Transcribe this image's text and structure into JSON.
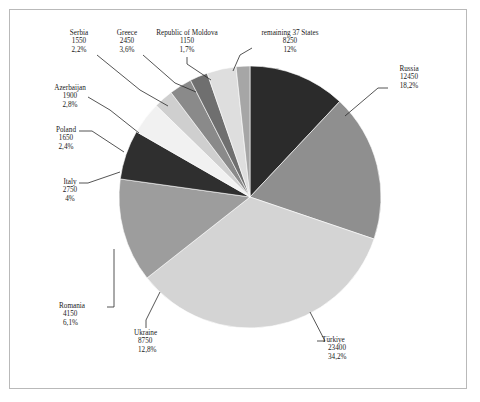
{
  "chart_data": {
    "type": "pie",
    "title": "",
    "subtitle": "",
    "xlabel": "",
    "ylabel": "",
    "legend_position": "callout-labels",
    "grid": false,
    "total": 68400,
    "value_label_separator": ",",
    "percent_symbol": "%",
    "categories": [
      "remaining 37 States",
      "Russia",
      "Türkiye",
      "Ukraine",
      "Romania",
      "Italy",
      "Poland",
      "Azerbaijan",
      "Serbia",
      "Greece",
      "Republic of Moldova"
    ],
    "values": [
      8250,
      12450,
      23400,
      8750,
      4150,
      2750,
      1650,
      1900,
      1550,
      2450,
      1150
    ],
    "percents": [
      "12%",
      "18,2%",
      "34,2%",
      "12,8%",
      "6,1%",
      "4%",
      "2,4%",
      "2,8%",
      "2,2%",
      "3,6%",
      "1,7%"
    ],
    "percent_numeric": [
      12.0,
      18.2,
      34.2,
      12.8,
      6.1,
      4.0,
      2.4,
      2.8,
      2.2,
      3.6,
      1.7
    ],
    "colors": [
      "#2b2b2b",
      "#8f8f8f",
      "#d4d4d4",
      "#9d9d9d",
      "#2f2f2f",
      "#f1f1f1",
      "#cfcfcf",
      "#8a8a8a",
      "#6f6f6f",
      "#dedede",
      "#a6a6a6"
    ],
    "slices": [
      {
        "label": "remaining 37 States",
        "value": "8250",
        "percent": "12%",
        "color": "#2b2b2b"
      },
      {
        "label": "Russia",
        "value": "12450",
        "percent": "18,2%",
        "color": "#8f8f8f"
      },
      {
        "label": "Türkiye",
        "value": "23400",
        "percent": "34,2%",
        "color": "#d4d4d4"
      },
      {
        "label": "Ukraine",
        "value": "8750",
        "percent": "12,8%",
        "color": "#9d9d9d"
      },
      {
        "label": "Romania",
        "value": "4150",
        "percent": "6,1%",
        "color": "#2f2f2f"
      },
      {
        "label": "Italy",
        "value": "2750",
        "percent": "4%",
        "color": "#f1f1f1"
      },
      {
        "label": "Poland",
        "value": "1650",
        "percent": "2,4%",
        "color": "#cfcfcf"
      },
      {
        "label": "Azerbaijan",
        "value": "1900",
        "percent": "2,8%",
        "color": "#8a8a8a"
      },
      {
        "label": "Serbia",
        "value": "1550",
        "percent": "2,2%",
        "color": "#6f6f6f"
      },
      {
        "label": "Greece",
        "value": "2450",
        "percent": "3,6%",
        "color": "#dedede"
      },
      {
        "label": "Republic of Moldova",
        "value": "1150",
        "percent": "1,7%",
        "color": "#a6a6a6"
      }
    ]
  },
  "labels": {
    "serbia": {
      "name": "Serbia",
      "value": "1550",
      "percent": "2,2%"
    },
    "greece": {
      "name": "Greece",
      "value": "2450",
      "percent": "3,6%"
    },
    "moldova": {
      "name": "Republic of Moldova",
      "value": "1150",
      "percent": "1,7%"
    },
    "remaining": {
      "name": "remaining 37 States",
      "value": "8250",
      "percent": "12%"
    },
    "russia": {
      "name": "Russia",
      "value": "12450",
      "percent": "18,2%"
    },
    "turkiye": {
      "name": "Türkiye",
      "value": "23400",
      "percent": "34,2%"
    },
    "ukraine": {
      "name": "Ukraine",
      "value": "8750",
      "percent": "12,8%"
    },
    "romania": {
      "name": "Romania",
      "value": "4150",
      "percent": "6,1%"
    },
    "italy": {
      "name": "Italy",
      "value": "2750",
      "percent": "4%"
    },
    "poland": {
      "name": "Poland",
      "value": "1650",
      "percent": "2,4%"
    },
    "azerbaijan": {
      "name": "Azerbaijan",
      "value": "1900",
      "percent": "2,8%"
    }
  },
  "style": {
    "border_color": "#b9b9b9",
    "leader_color": "#2a2a2a",
    "text_color": "#1a1a1a",
    "background": "#ffffff"
  }
}
